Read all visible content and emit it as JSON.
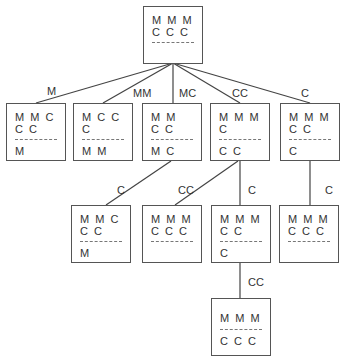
{
  "diagram": {
    "title": "",
    "nodes": {
      "root": {
        "left_row1": "M  M  M",
        "left_row2": "C  C  C",
        "right": ""
      },
      "n1": {
        "left_row1": "M  M  C",
        "left_row2": "C  C",
        "right": "M"
      },
      "n2": {
        "left_row1": "M  C  C",
        "left_row2": "C",
        "right": "M  M"
      },
      "n3": {
        "left_row1": "M  M",
        "left_row2": "C  C",
        "right": "M  C"
      },
      "n4": {
        "left_row1": "M  M  M",
        "left_row2": "C",
        "right": "C  C"
      },
      "n5": {
        "left_row1": "M  M  M",
        "left_row2": "C  C",
        "right": "C"
      },
      "n6": {
        "left_row1": "M  M  C",
        "left_row2": "C  C",
        "right": "M"
      },
      "n7": {
        "left_row1": "M  M  M",
        "left_row2": "C  C  C",
        "right": ""
      },
      "n8": {
        "left_row1": "M  M  M",
        "left_row2": "C  C",
        "right": "C"
      },
      "n9": {
        "left_row1": "M  M  M",
        "left_row2": "C  C  C",
        "right": ""
      },
      "goal": {
        "left_row1": "M  M  M",
        "left_row2": "",
        "right": "C  C  C"
      }
    },
    "edges": [
      {
        "from": "root",
        "to": "n1",
        "label": "M"
      },
      {
        "from": "root",
        "to": "n2",
        "label": "MM"
      },
      {
        "from": "root",
        "to": "n3",
        "label": "MC"
      },
      {
        "from": "root",
        "to": "n4",
        "label": "CC"
      },
      {
        "from": "root",
        "to": "n5",
        "label": "C"
      },
      {
        "from": "n3",
        "to": "n6",
        "label": "C"
      },
      {
        "from": "n4",
        "to": "n7",
        "label": "CC"
      },
      {
        "from": "n4",
        "to": "n8",
        "label": "C"
      },
      {
        "from": "n5",
        "to": "n9",
        "label": "C"
      },
      {
        "from": "n8",
        "to": "goal",
        "label": "CC"
      }
    ]
  }
}
